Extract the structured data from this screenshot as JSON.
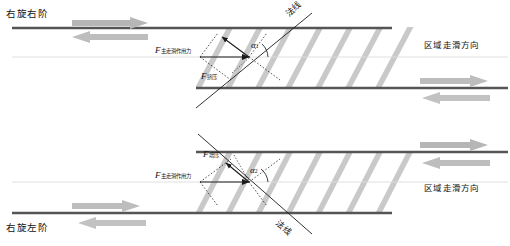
{
  "figure": {
    "title_top_left": "右旋右阶",
    "title_bottom_left": "右旋左阶",
    "colors": {
      "fault_line": "#555555",
      "echelon_band": "#c8c8c8",
      "shear_arrow": "#b4b4b4",
      "annotation": "#1b1b1b",
      "background": "#ffffff"
    }
  },
  "panels": [
    {
      "id": "top",
      "corner_label": "右旋右阶",
      "region_label": "区域走滑方向",
      "normal_label": "法线",
      "angle_label": "α",
      "angle_sub": "1",
      "force_main_label": "F",
      "force_main_sub": "主走滑作用力",
      "force_secondary_label": "F",
      "force_secondary_sub": "挤压",
      "shear_sense": "dextral",
      "step_sense": "right-stepping",
      "echelon_dip": "down-right"
    },
    {
      "id": "bottom",
      "corner_label": "右旋左阶",
      "region_label": "区域走滑方向",
      "normal_label": "法线",
      "angle_label": "α",
      "angle_sub": "2",
      "force_main_label": "F",
      "force_main_sub": "主走滑作用力",
      "force_secondary_label": "F",
      "force_secondary_sub": "增压",
      "shear_sense": "dextral",
      "step_sense": "left-stepping",
      "echelon_dip": "up-right"
    }
  ]
}
